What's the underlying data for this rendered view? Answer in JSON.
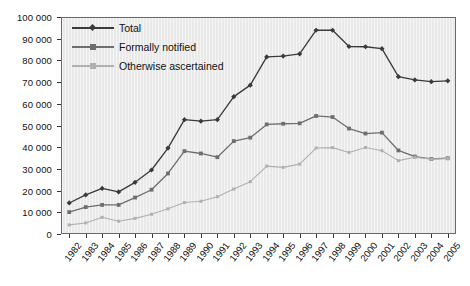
{
  "chart_data": {
    "type": "line",
    "title": "",
    "xlabel": "",
    "ylabel": "",
    "ylim": [
      0,
      100000
    ],
    "ytick_step": 10000,
    "grid": false,
    "legend_position": "top-left",
    "categories": [
      "1982",
      "1983",
      "1984",
      "1985",
      "1986",
      "1987",
      "1988",
      "1989",
      "1990",
      "1991",
      "1992",
      "1993",
      "1994",
      "1995",
      "1996",
      "1997",
      "1998",
      "1999",
      "2000",
      "2001",
      "2002",
      "2003",
      "2004",
      "2005"
    ],
    "ytick_labels": [
      "0",
      "10 000",
      "20 000",
      "30 000",
      "40 000",
      "50 000",
      "60 000",
      "70 000",
      "80 000",
      "90 000",
      "100 000"
    ],
    "ytick_values": [
      0,
      10000,
      20000,
      30000,
      40000,
      50000,
      60000,
      70000,
      80000,
      90000,
      100000
    ],
    "series": [
      {
        "name": "Total",
        "color": "#3a3a3a",
        "marker": "diamond",
        "values": [
          14300,
          18000,
          21000,
          19400,
          23800,
          29500,
          39600,
          52700,
          52000,
          52700,
          63300,
          68600,
          81600,
          82000,
          83000,
          93900,
          93900,
          86400,
          86300,
          85400,
          72500,
          71000,
          70200,
          70600
        ]
      },
      {
        "name": "Formally notified",
        "color": "#6e6e6e",
        "marker": "square",
        "values": [
          10100,
          12400,
          13400,
          13400,
          16800,
          20400,
          27900,
          38200,
          37100,
          35400,
          42800,
          44400,
          50500,
          50800,
          51000,
          54400,
          53900,
          48600,
          46300,
          46700,
          38500,
          35700,
          34600,
          34900
        ]
      },
      {
        "name": "Otherwise ascertained",
        "color": "#b0b0b0",
        "marker": "square",
        "values": [
          4200,
          5100,
          7700,
          5900,
          7200,
          9100,
          11600,
          14500,
          15100,
          17200,
          20700,
          24100,
          31300,
          30700,
          32200,
          39600,
          39800,
          37600,
          39900,
          38400,
          33800,
          35400,
          34500,
          34800
        ]
      }
    ]
  },
  "colors": {
    "plot_background": "#e9e9e9",
    "frame": "#6a6a6a",
    "axis_text": "#111111",
    "total": "#3a3a3a",
    "formally_notified": "#6e6e6e",
    "otherwise_ascertained": "#b0b0b0"
  }
}
